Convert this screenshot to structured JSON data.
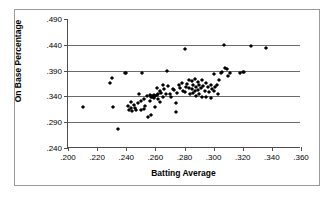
{
  "chart_data": {
    "type": "scatter",
    "title": "",
    "xlabel": "Batting Average",
    "ylabel": "On Base Percentage",
    "xlim": [
      0.2,
      0.36
    ],
    "ylim": [
      0.24,
      0.49
    ],
    "xticks": [
      ".200",
      ".220",
      ".240",
      ".260",
      ".280",
      ".300",
      ".320",
      ".340",
      ".360"
    ],
    "xtick_values": [
      0.2,
      0.22,
      0.24,
      0.26,
      0.28,
      0.3,
      0.32,
      0.34,
      0.36
    ],
    "yticks": [
      ".240",
      ".290",
      ".340",
      ".390",
      ".440",
      ".490"
    ],
    "ytick_values": [
      0.24,
      0.29,
      0.34,
      0.39,
      0.44,
      0.49
    ],
    "grid": "horizontal",
    "gridline_values": [
      0.29,
      0.34,
      0.39,
      0.44
    ],
    "legend": "none",
    "marker": "diamond",
    "marker_color": "#000000",
    "series": [
      {
        "name": "Players",
        "x": [
          0.21,
          0.229,
          0.23,
          0.231,
          0.234,
          0.239,
          0.24,
          0.241,
          0.242,
          0.243,
          0.243,
          0.244,
          0.245,
          0.246,
          0.247,
          0.248,
          0.249,
          0.25,
          0.25,
          0.251,
          0.252,
          0.252,
          0.253,
          0.254,
          0.255,
          0.256,
          0.256,
          0.257,
          0.257,
          0.258,
          0.258,
          0.259,
          0.259,
          0.26,
          0.26,
          0.261,
          0.261,
          0.262,
          0.262,
          0.263,
          0.263,
          0.264,
          0.265,
          0.265,
          0.266,
          0.267,
          0.268,
          0.269,
          0.27,
          0.271,
          0.272,
          0.273,
          0.274,
          0.274,
          0.275,
          0.276,
          0.277,
          0.278,
          0.279,
          0.28,
          0.28,
          0.281,
          0.282,
          0.283,
          0.283,
          0.284,
          0.285,
          0.285,
          0.286,
          0.286,
          0.287,
          0.287,
          0.288,
          0.288,
          0.289,
          0.289,
          0.29,
          0.29,
          0.291,
          0.292,
          0.292,
          0.293,
          0.294,
          0.295,
          0.295,
          0.296,
          0.297,
          0.298,
          0.298,
          0.299,
          0.3,
          0.3,
          0.301,
          0.302,
          0.303,
          0.304,
          0.305,
          0.306,
          0.307,
          0.308,
          0.309,
          0.31,
          0.311,
          0.318,
          0.32,
          0.321,
          0.326,
          0.336
        ],
        "y": [
          0.32,
          0.366,
          0.375,
          0.32,
          0.277,
          0.385,
          0.386,
          0.322,
          0.313,
          0.317,
          0.33,
          0.312,
          0.324,
          0.318,
          0.313,
          0.327,
          0.345,
          0.313,
          0.332,
          0.386,
          0.315,
          0.335,
          0.322,
          0.34,
          0.3,
          0.331,
          0.342,
          0.304,
          0.339,
          0.338,
          0.341,
          0.337,
          0.343,
          0.32,
          0.34,
          0.342,
          0.357,
          0.334,
          0.345,
          0.33,
          0.35,
          0.347,
          0.339,
          0.362,
          0.355,
          0.344,
          0.39,
          0.36,
          0.345,
          0.338,
          0.354,
          0.352,
          0.31,
          0.328,
          0.347,
          0.362,
          0.356,
          0.366,
          0.351,
          0.349,
          0.432,
          0.358,
          0.364,
          0.357,
          0.371,
          0.344,
          0.355,
          0.37,
          0.346,
          0.362,
          0.35,
          0.374,
          0.341,
          0.359,
          0.352,
          0.368,
          0.345,
          0.363,
          0.356,
          0.338,
          0.372,
          0.36,
          0.351,
          0.338,
          0.366,
          0.358,
          0.348,
          0.336,
          0.362,
          0.355,
          0.35,
          0.384,
          0.358,
          0.363,
          0.345,
          0.371,
          0.385,
          0.388,
          0.44,
          0.395,
          0.393,
          0.38,
          0.386,
          0.386,
          0.387,
          0.387,
          0.438,
          0.434
        ]
      }
    ]
  }
}
